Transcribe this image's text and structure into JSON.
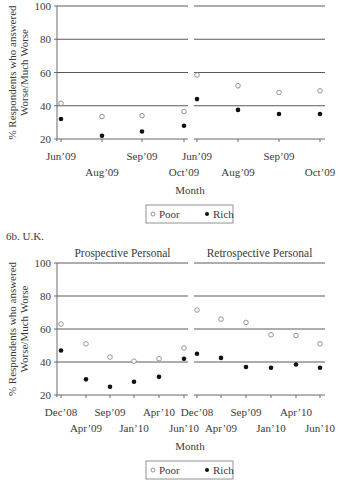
{
  "chart_data": [
    {
      "type": "scatter",
      "figure_label": "",
      "panels": [
        {
          "title": "Prospective Personal",
          "categories": [
            "Jun'09",
            "Aug'09",
            "Sep'09",
            "Oct'09"
          ],
          "series": [
            {
              "name": "Poor",
              "marker": "hollow-circle",
              "values": [
                41.5,
                33.5,
                34,
                36.5
              ]
            },
            {
              "name": "Rich",
              "marker": "filled-circle",
              "values": [
                32,
                22,
                24.5,
                28
              ]
            }
          ]
        },
        {
          "title": "Retrospective Personal",
          "categories": [
            "Jun'09",
            "Aug'09",
            "Sep'09",
            "Oct'09"
          ],
          "series": [
            {
              "name": "Poor",
              "marker": "hollow-circle",
              "values": [
                58.5,
                52,
                48,
                49
              ]
            },
            {
              "name": "Rich",
              "marker": "filled-circle",
              "values": [
                44,
                37.5,
                35,
                35
              ]
            }
          ]
        }
      ],
      "xlabel": "Month",
      "ylabel": "% Respondents who answered Worse/Much Worse",
      "ylabel_lines": [
        "% Respondents who answered",
        "Worse/Much Worse"
      ],
      "yticks": [
        20,
        40,
        60,
        80,
        100
      ],
      "ylim": [
        20,
        100
      ],
      "grid": true,
      "legend": [
        "Poor",
        "Rich"
      ],
      "legend_position": "bottom"
    },
    {
      "type": "scatter",
      "figure_label": "6b. U.K.",
      "panels": [
        {
          "title": "Prospective Personal",
          "categories": [
            "Dec'08",
            "Apr'09",
            "Sep'09",
            "Jan'10",
            "Apr'10",
            "Jun'10"
          ],
          "series": [
            {
              "name": "Poor",
              "marker": "hollow-circle",
              "values": [
                63,
                51,
                43,
                40.5,
                42,
                48.5
              ]
            },
            {
              "name": "Rich",
              "marker": "filled-circle",
              "values": [
                47,
                29.5,
                25,
                28,
                31,
                42
              ]
            }
          ]
        },
        {
          "title": "Retrospective Personal",
          "categories": [
            "Dec'08",
            "Apr'09",
            "Sep'09",
            "Jan'10",
            "Apr'10",
            "Jun'10"
          ],
          "series": [
            {
              "name": "Poor",
              "marker": "hollow-circle",
              "values": [
                71.5,
                66,
                64,
                56.5,
                56,
                51
              ]
            },
            {
              "name": "Rich",
              "marker": "filled-circle",
              "values": [
                45,
                42.5,
                37,
                36.5,
                38.5,
                36.5
              ]
            }
          ]
        }
      ],
      "xlabel": "Month",
      "ylabel": "% Respondents who answered Worse/Much Worse",
      "ylabel_lines": [
        "% Respondents who answered",
        "Worse/Much Worse"
      ],
      "yticks": [
        20,
        40,
        60,
        80,
        100
      ],
      "ylim": [
        20,
        100
      ],
      "grid": true,
      "legend": [
        "Poor",
        "Rich"
      ],
      "legend_position": "bottom"
    }
  ],
  "colors": {
    "axis": "#6b6b6b",
    "grid": "#5a5a5a",
    "poor_stroke": "#8a8a8a",
    "rich_fill": "#111111"
  }
}
